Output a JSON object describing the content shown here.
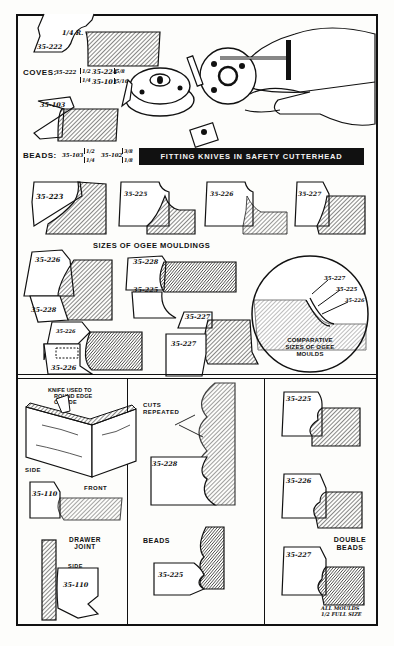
{
  "diagram": {
    "title": "FITTING KNIVES IN SAFETY CUTTERHEAD",
    "colors": {
      "ink": "#111111",
      "paper": "#fdfdfb",
      "banner_bg": "#111111",
      "banner_text": "#f4f4f4"
    },
    "top_panel": {
      "cove_example": {
        "label": "35-222",
        "radius_note": "1/4 R."
      },
      "coves": {
        "heading": "COVES:",
        "items": [
          {
            "code": "35-222",
            "sizes": [
              "1/2",
              "1/4"
            ]
          },
          {
            "code": "35-224",
            "sizes": [
              "5/8"
            ]
          },
          {
            "code": "35-101",
            "sizes": [
              "5/16"
            ]
          }
        ]
      },
      "bead_example": {
        "label": "35-103"
      },
      "beads": {
        "heading": "BEADS:",
        "items": [
          {
            "code": "35-103",
            "sizes": [
              "1/2",
              "1/4"
            ]
          },
          {
            "code": "35-102",
            "sizes": [
              "3/8",
              "1/8"
            ]
          }
        ]
      },
      "ogee_row": [
        "35-223",
        "35-225",
        "35-226",
        "35-227"
      ],
      "ogee_heading": "SIZES OF OGEE MOULDINGS",
      "combos": [
        {
          "top": "35-226",
          "bottom": "35-228"
        },
        {
          "top": "35-228",
          "bottom": "35-225"
        },
        {
          "top": "35-226",
          "bottom": "35-226"
        },
        {
          "top": "35-227",
          "bottom": "35-227"
        }
      ],
      "comparison_circle": {
        "labels": [
          "35-227",
          "35-225",
          "35-226"
        ],
        "caption": [
          "COMPARATIVE",
          "SIZES OF OGEE",
          "MOULDS"
        ]
      }
    },
    "bottom_left": {
      "knife_note": [
        "KNIFE USED TO",
        "ROUND EDGE",
        "OF SIDE"
      ],
      "side_label": "SIDE",
      "front_label": "FRONT",
      "cutter_label": "35-110",
      "joint_title": [
        "DRAWER",
        "JOINT"
      ],
      "side_arrow_label": "SIDE",
      "cutter_label_2": "35-110"
    },
    "bottom_middle": {
      "cuts_note": [
        "CUTS",
        "REPEATED"
      ],
      "cutter_top": "35-228",
      "beads_heading": "BEADS",
      "cutter_bottom": "35-225"
    },
    "bottom_right": {
      "cutters": [
        "35-225",
        "35-226",
        "35-227"
      ],
      "heading": [
        "DOUBLE",
        "BEADS"
      ],
      "footnote": [
        "ALL MOULDS",
        "1/2 FULL SIZE"
      ]
    }
  }
}
